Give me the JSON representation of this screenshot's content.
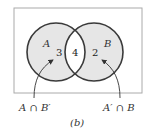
{
  "diagram": {
    "type": "venn",
    "caption": "(b)",
    "colors": {
      "shade": "#e6e6e6",
      "stroke": "#3a3a3a",
      "frame": "#aaaaaa",
      "background": "#ffffff"
    },
    "sets": [
      {
        "name": "A",
        "only_count": "3"
      },
      {
        "name": "B",
        "only_count": "2"
      }
    ],
    "intersection_count": "4",
    "annotations": [
      {
        "label": "A ∩ B′",
        "points_to": "A only"
      },
      {
        "label": "A′ ∩ B",
        "points_to": "B only"
      }
    ]
  }
}
